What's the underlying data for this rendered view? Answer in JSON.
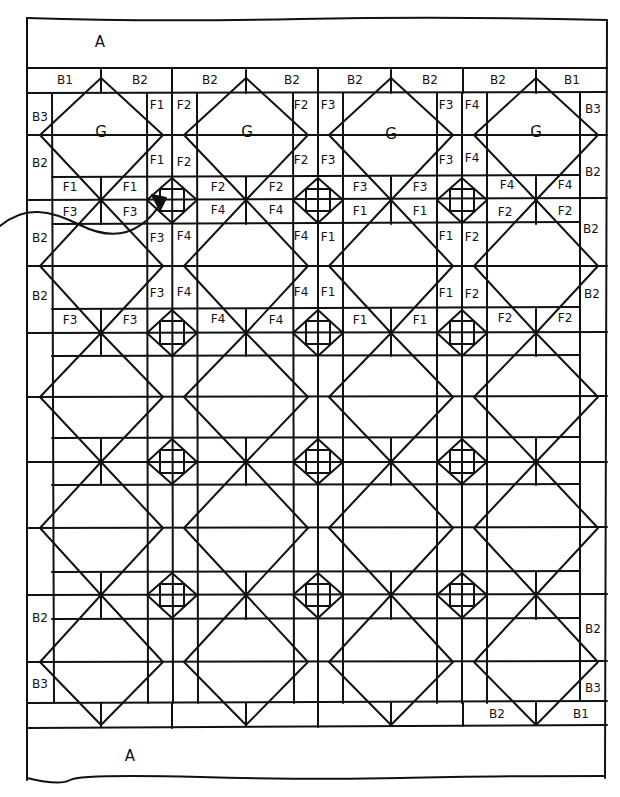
{
  "diagram": {
    "ink_color": "#111111",
    "background": "#ffffff",
    "borders": {
      "top_band": "A",
      "bottom_band": "A"
    },
    "labels": [
      {
        "id": "a_top",
        "text": "A",
        "x": 100,
        "y": 42,
        "size": "big"
      },
      {
        "id": "a_bot",
        "text": "A",
        "x": 130,
        "y": 756,
        "size": "big"
      },
      {
        "id": "t1",
        "text": "B1",
        "x": 65,
        "y": 80
      },
      {
        "id": "t2",
        "text": "B2",
        "x": 140,
        "y": 80
      },
      {
        "id": "t3",
        "text": "B2",
        "x": 210,
        "y": 80
      },
      {
        "id": "t4",
        "text": "B2",
        "x": 292,
        "y": 80
      },
      {
        "id": "t5",
        "text": "B2",
        "x": 355,
        "y": 80
      },
      {
        "id": "t6",
        "text": "B2",
        "x": 430,
        "y": 80
      },
      {
        "id": "t7",
        "text": "B2",
        "x": 498,
        "y": 80
      },
      {
        "id": "t8",
        "text": "B1",
        "x": 572,
        "y": 80
      },
      {
        "id": "l1",
        "text": "B3",
        "x": 40,
        "y": 117
      },
      {
        "id": "l2",
        "text": "B2",
        "x": 40,
        "y": 163
      },
      {
        "id": "l3",
        "text": "B2",
        "x": 40,
        "y": 238
      },
      {
        "id": "l4",
        "text": "B2",
        "x": 40,
        "y": 296
      },
      {
        "id": "l5",
        "text": "B2",
        "x": 40,
        "y": 618
      },
      {
        "id": "l6",
        "text": "B3",
        "x": 40,
        "y": 684
      },
      {
        "id": "r1",
        "text": "B3",
        "x": 593,
        "y": 109
      },
      {
        "id": "r2",
        "text": "B2",
        "x": 593,
        "y": 172
      },
      {
        "id": "r3",
        "text": "B2",
        "x": 591,
        "y": 229
      },
      {
        "id": "r4",
        "text": "B2",
        "x": 592,
        "y": 294
      },
      {
        "id": "r5",
        "text": "B2",
        "x": 593,
        "y": 629
      },
      {
        "id": "r6",
        "text": "B3",
        "x": 593,
        "y": 688
      },
      {
        "id": "b1",
        "text": "B2",
        "x": 497,
        "y": 714
      },
      {
        "id": "b2",
        "text": "B1",
        "x": 581,
        "y": 714
      },
      {
        "id": "g1",
        "text": "G",
        "x": 101,
        "y": 132,
        "size": "g"
      },
      {
        "id": "g2",
        "text": "G",
        "x": 247,
        "y": 132,
        "size": "g"
      },
      {
        "id": "g3",
        "text": "G",
        "x": 391,
        "y": 134,
        "size": "g"
      },
      {
        "id": "g4",
        "text": "G",
        "x": 536,
        "y": 132,
        "size": "g"
      },
      {
        "id": "s1a",
        "text": "F1",
        "x": 157,
        "y": 105
      },
      {
        "id": "s1b",
        "text": "F2",
        "x": 184,
        "y": 105
      },
      {
        "id": "s1c",
        "text": "F1",
        "x": 157,
        "y": 160
      },
      {
        "id": "s1d",
        "text": "F2",
        "x": 184,
        "y": 162
      },
      {
        "id": "s2a",
        "text": "F2",
        "x": 301,
        "y": 105
      },
      {
        "id": "s2b",
        "text": "F3",
        "x": 328,
        "y": 105
      },
      {
        "id": "s2c",
        "text": "F2",
        "x": 301,
        "y": 160
      },
      {
        "id": "s2d",
        "text": "F3",
        "x": 328,
        "y": 160
      },
      {
        "id": "s3a",
        "text": "F3",
        "x": 446,
        "y": 105
      },
      {
        "id": "s3b",
        "text": "F4",
        "x": 472,
        "y": 105
      },
      {
        "id": "s3c",
        "text": "F3",
        "x": 446,
        "y": 160
      },
      {
        "id": "s3d",
        "text": "F4",
        "x": 472,
        "y": 158
      },
      {
        "id": "h1a",
        "text": "F1",
        "x": 70,
        "y": 187
      },
      {
        "id": "h1b",
        "text": "F1",
        "x": 130,
        "y": 187
      },
      {
        "id": "h1c",
        "text": "F2",
        "x": 218,
        "y": 187
      },
      {
        "id": "h1d",
        "text": "F2",
        "x": 276,
        "y": 187
      },
      {
        "id": "h1e",
        "text": "F3",
        "x": 360,
        "y": 187
      },
      {
        "id": "h1f",
        "text": "F3",
        "x": 420,
        "y": 187
      },
      {
        "id": "h1g",
        "text": "F4",
        "x": 507,
        "y": 185
      },
      {
        "id": "h1h",
        "text": "F4",
        "x": 565,
        "y": 185
      },
      {
        "id": "h2a",
        "text": "F3",
        "x": 70,
        "y": 212
      },
      {
        "id": "h2b",
        "text": "F3",
        "x": 130,
        "y": 212
      },
      {
        "id": "h2c",
        "text": "F4",
        "x": 218,
        "y": 210
      },
      {
        "id": "h2d",
        "text": "F4",
        "x": 276,
        "y": 210
      },
      {
        "id": "h2e",
        "text": "F1",
        "x": 360,
        "y": 211
      },
      {
        "id": "h2f",
        "text": "F1",
        "x": 420,
        "y": 211
      },
      {
        "id": "h2g",
        "text": "F2",
        "x": 505,
        "y": 212
      },
      {
        "id": "h2h",
        "text": "F2",
        "x": 565,
        "y": 211
      },
      {
        "id": "v1a",
        "text": "F3",
        "x": 157,
        "y": 238
      },
      {
        "id": "v1b",
        "text": "F4",
        "x": 184,
        "y": 236
      },
      {
        "id": "v1c",
        "text": "F3",
        "x": 157,
        "y": 293
      },
      {
        "id": "v1d",
        "text": "F4",
        "x": 184,
        "y": 292
      },
      {
        "id": "v2a",
        "text": "F4",
        "x": 301,
        "y": 236
      },
      {
        "id": "v2b",
        "text": "F1",
        "x": 328,
        "y": 237
      },
      {
        "id": "v2c",
        "text": "F4",
        "x": 301,
        "y": 292
      },
      {
        "id": "v2d",
        "text": "F1",
        "x": 328,
        "y": 292
      },
      {
        "id": "v3a",
        "text": "F1",
        "x": 446,
        "y": 236
      },
      {
        "id": "v3b",
        "text": "F2",
        "x": 472,
        "y": 237
      },
      {
        "id": "v3c",
        "text": "F1",
        "x": 446,
        "y": 293
      },
      {
        "id": "v3d",
        "text": "F2",
        "x": 472,
        "y": 294
      },
      {
        "id": "h3a",
        "text": "F3",
        "x": 70,
        "y": 320
      },
      {
        "id": "h3b",
        "text": "F3",
        "x": 130,
        "y": 320
      },
      {
        "id": "h3c",
        "text": "F4",
        "x": 218,
        "y": 319
      },
      {
        "id": "h3d",
        "text": "F4",
        "x": 276,
        "y": 320
      },
      {
        "id": "h3e",
        "text": "F1",
        "x": 360,
        "y": 320
      },
      {
        "id": "h3f",
        "text": "F1",
        "x": 420,
        "y": 320
      },
      {
        "id": "h3g",
        "text": "F2",
        "x": 505,
        "y": 318
      },
      {
        "id": "h3h",
        "text": "F2",
        "x": 565,
        "y": 318
      }
    ]
  }
}
